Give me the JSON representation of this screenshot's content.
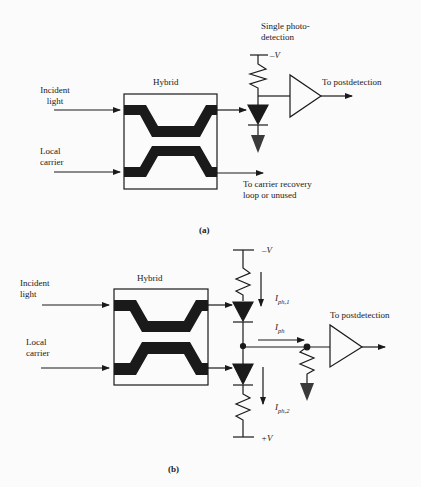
{
  "panel_a": {
    "caption": "(a)",
    "hybrid_label": "Hybrid",
    "input_top": [
      "Incident",
      "light"
    ],
    "input_bottom": [
      "Local",
      "carrier"
    ],
    "detector_title": [
      "Single photo-",
      "detection"
    ],
    "supply": "–V",
    "output": "To postdetection",
    "unused_port": [
      "To carrier recovery",
      "loop or unused"
    ]
  },
  "panel_b": {
    "caption": "(b)",
    "hybrid_label": "Hybrid",
    "input_top": [
      "Incident",
      "light"
    ],
    "input_bottom": [
      "Local",
      "carrier"
    ],
    "supply_top": "–V",
    "supply_bottom": "+V",
    "current_1": {
      "main": "I",
      "sub": "ph,1"
    },
    "current_2": {
      "main": "I",
      "sub": "ph,2"
    },
    "current_out": {
      "main": "I",
      "sub": "ph"
    },
    "output": "To postdetection"
  },
  "colors": {
    "ink": "#1a1a1a",
    "ground": "#3a3a3a",
    "background": "#fbfbfb"
  }
}
